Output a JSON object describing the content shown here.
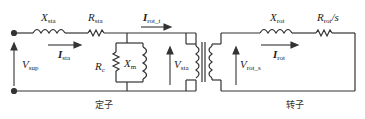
{
  "diagram": {
    "stroke_color": "#333333",
    "components": {
      "stator_reactance": {
        "symbol": "X",
        "sub": "sta"
      },
      "stator_resistance": {
        "symbol": "R",
        "sub": "sta"
      },
      "core_resistance": {
        "symbol": "R",
        "sub": "c"
      },
      "magnetizing_reactance": {
        "symbol": "X",
        "sub": "m"
      },
      "rotor_reactance": {
        "symbol": "X",
        "sub": "rot"
      },
      "rotor_resistance": {
        "symbol": "R",
        "sub": "rot",
        "suffix": "/s"
      }
    },
    "quantities": {
      "supply_voltage": {
        "symbol": "V",
        "sub": "sup"
      },
      "stator_current": {
        "symbol": "I",
        "sub": "sta"
      },
      "rotor_transferred_current": {
        "symbol": "I",
        "sub": "rot_t"
      },
      "stator_voltage": {
        "symbol": "V",
        "sub": "sta"
      },
      "rotor_voltage": {
        "symbol": "V",
        "sub": "rot_s"
      },
      "rotor_current": {
        "symbol": "I",
        "sub": "rot"
      }
    },
    "section_labels": {
      "stator": "定子",
      "rotor": "转子"
    }
  }
}
